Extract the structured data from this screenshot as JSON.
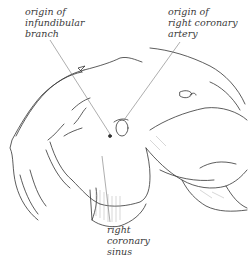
{
  "figure": {
    "labels": {
      "infundibular_branch": {
        "lines": [
          "origin of",
          "infundibular",
          "branch"
        ]
      },
      "right_coronary_artery": {
        "lines": [
          "origin of",
          "right coronary",
          "artery"
        ]
      },
      "right_coronary_sinus": {
        "lines": [
          "right",
          "coronary",
          "sinus"
        ]
      }
    },
    "colors": {
      "background": "#ffffff",
      "ink": "#333333",
      "leader_line": "#777777",
      "text": "#3a3a3a"
    }
  }
}
